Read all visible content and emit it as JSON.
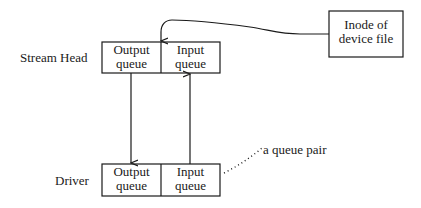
{
  "diagram": {
    "type": "streams-structure",
    "labels": {
      "stream_head": "Stream Head",
      "driver": "Driver",
      "queue_pair": "a queue pair"
    },
    "stream_head_module": {
      "output_queue": {
        "line1": "Output",
        "line2": "queue"
      },
      "input_queue": {
        "line1": "Input",
        "line2": "queue"
      }
    },
    "driver_module": {
      "output_queue": {
        "line1": "Output",
        "line2": "queue"
      },
      "input_queue": {
        "line1": "Input",
        "line2": "queue"
      }
    },
    "inode_box": {
      "line1": "Inode of",
      "line2": "device file"
    },
    "edges": [
      {
        "from": "inode_box",
        "to": "stream_head_module",
        "style": "curved-arrow"
      },
      {
        "from": "stream_head_module.output_queue",
        "to": "driver_module.output_queue",
        "style": "arrow-down"
      },
      {
        "from": "driver_module.input_queue",
        "to": "stream_head_module.input_queue",
        "style": "arrow-up"
      },
      {
        "from": "queue_pair_label",
        "to": "driver_module",
        "style": "dotted"
      }
    ],
    "stroke_color": "#1a1a1a"
  }
}
